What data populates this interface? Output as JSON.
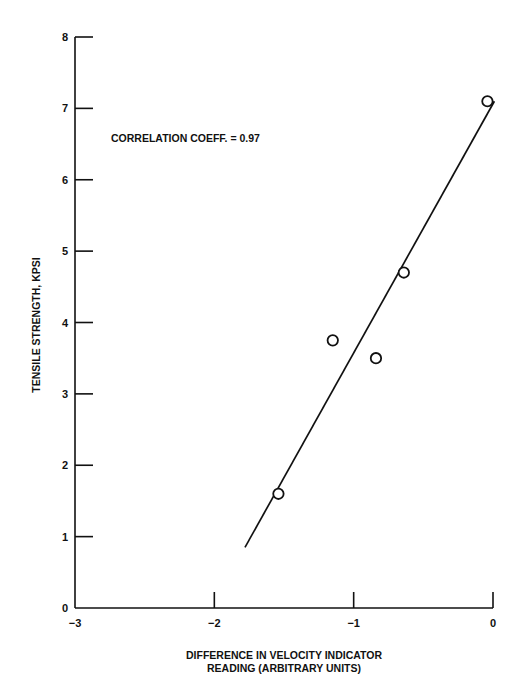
{
  "chart_data": {
    "type": "scatter",
    "title": "",
    "xlabel": "DIFFERENCE IN VELOCITY INDICATOR READING (ARBITRARY UNITS)",
    "xlabel_lines": [
      "DIFFERENCE IN VELOCITY INDICATOR",
      "READING (ARBITRARY UNITS)"
    ],
    "ylabel": "TENSILE STRENGTH, KPSI",
    "xlim": [
      -3,
      0
    ],
    "ylim": [
      0,
      8
    ],
    "x_ticks": [
      -3,
      -2,
      -1,
      0
    ],
    "x_tick_labels": [
      "−3",
      "−2",
      "−1",
      "0"
    ],
    "y_ticks": [
      0,
      1,
      2,
      3,
      4,
      5,
      6,
      7,
      8
    ],
    "y_tick_labels": [
      "0",
      "1",
      "2",
      "3",
      "4",
      "5",
      "6",
      "7",
      "8"
    ],
    "grid": false,
    "legend": null,
    "series": [
      {
        "name": "Measurements",
        "marker": "open-circle",
        "points": [
          {
            "x": -1.54,
            "y": 1.6
          },
          {
            "x": -1.15,
            "y": 3.75
          },
          {
            "x": -0.84,
            "y": 3.5
          },
          {
            "x": -0.64,
            "y": 4.7
          },
          {
            "x": -0.04,
            "y": 7.1
          }
        ]
      }
    ],
    "fit_line": {
      "name": "Linear fit",
      "from": {
        "x": -1.78,
        "y": 0.85
      },
      "to": {
        "x": 0.01,
        "y": 7.1
      }
    },
    "annotations": [
      {
        "text": "CORRELATION COEFF. = 0.97",
        "x": -2.8,
        "y": 6.65
      }
    ]
  },
  "colors": {
    "ink": "#111111",
    "background": "#ffffff"
  }
}
